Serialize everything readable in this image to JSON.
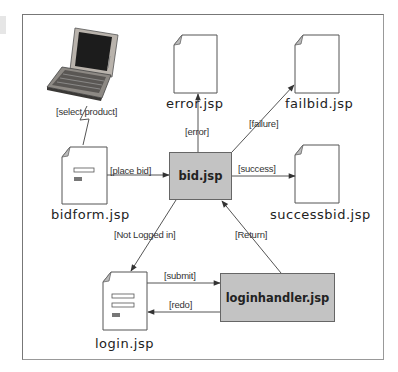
{
  "diagram": {
    "type": "page-flow",
    "nodes": {
      "client": {
        "icon": "laptop-icon"
      },
      "bidform": {
        "label": "bidform.jsp",
        "kind": "form-page"
      },
      "bid": {
        "label": "bid.jsp",
        "kind": "handler"
      },
      "error": {
        "label": "error.jsp",
        "kind": "page"
      },
      "failbid": {
        "label": "failbid.jsp",
        "kind": "page"
      },
      "successbid": {
        "label": "successbid.jsp",
        "kind": "page"
      },
      "login": {
        "label": "login.jsp",
        "kind": "form-page"
      },
      "loginhandler": {
        "label": "loginhandler.jsp",
        "kind": "handler"
      }
    },
    "edges": {
      "select_product": {
        "from": "client",
        "to": "bidform",
        "label": "[select product]"
      },
      "place_bid": {
        "from": "bidform",
        "to": "bid",
        "label": "[place bid]"
      },
      "error": {
        "from": "bid",
        "to": "error",
        "label": "[error]"
      },
      "failure": {
        "from": "bid",
        "to": "failbid",
        "label": "[failure]"
      },
      "success": {
        "from": "bid",
        "to": "successbid",
        "label": "[success]"
      },
      "not_logged_in": {
        "from": "bid",
        "to": "login",
        "label": "[Not Logged in]"
      },
      "submit": {
        "from": "login",
        "to": "loginhandler",
        "label": "[submit]"
      },
      "redo": {
        "from": "loginhandler",
        "to": "login",
        "label": "[redo]"
      },
      "return": {
        "from": "loginhandler",
        "to": "bid",
        "label": "[Return]"
      }
    },
    "colors": {
      "handler_fill": "#c3c3c3",
      "line": "#555555",
      "doc_fold": "#bbbbbb"
    }
  }
}
